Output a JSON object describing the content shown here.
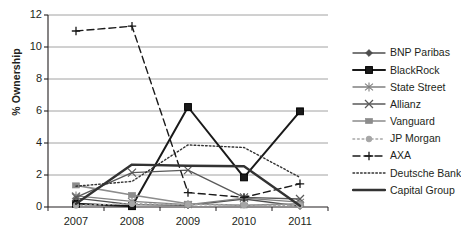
{
  "chart_data": {
    "type": "line",
    "title": "",
    "xlabel": "",
    "ylabel": "% Ownership",
    "categories": [
      "2007",
      "2008",
      "2009",
      "2010",
      "2011"
    ],
    "x_tick_labels": [
      "2007",
      "2008",
      "2009",
      "2010",
      "2011"
    ],
    "y_tick_labels": [
      "0",
      "2",
      "4",
      "6",
      "8",
      "10",
      "12"
    ],
    "y_ticks": [
      0,
      2,
      4,
      6,
      8,
      10,
      12
    ],
    "ylim": [
      0,
      12
    ],
    "grid": "horizontal",
    "legend_position": "right",
    "series": [
      {
        "name": "BNP Paribas",
        "values": [
          0.55,
          0.15,
          0.1,
          0.5,
          0.05
        ],
        "color": "#4d4d4d",
        "marker": "diamond",
        "dash": "solid",
        "width": 1.3
      },
      {
        "name": "BlackRock",
        "values": [
          0.2,
          0.05,
          6.25,
          1.85,
          5.98
        ],
        "color": "#1a1a1a",
        "marker": "square",
        "dash": "solid",
        "width": 2.0
      },
      {
        "name": "State Street",
        "values": [
          0.7,
          0.35,
          0.15,
          0.55,
          0.3
        ],
        "color": "#808080",
        "marker": "star",
        "dash": "solid",
        "width": 1.3
      },
      {
        "name": "Allianz",
        "values": [
          0.6,
          2.15,
          2.3,
          0.6,
          0.5
        ],
        "color": "#595959",
        "marker": "cross",
        "dash": "solid",
        "width": 1.3
      },
      {
        "name": "Vanguard",
        "values": [
          1.35,
          0.75,
          0.2,
          0.1,
          0.2
        ],
        "color": "#8c8c8c",
        "marker": "bar",
        "dash": "solid",
        "width": 1.6
      },
      {
        "name": "JP Morgan",
        "values": [
          0.1,
          0.2,
          0.15,
          0.12,
          0.1
        ],
        "color": "#a6a6a6",
        "marker": "circle",
        "dash": "dotted",
        "width": 1.6
      },
      {
        "name": "AXA",
        "values": [
          11.0,
          11.3,
          0.9,
          0.6,
          1.45
        ],
        "color": "#1a1a1a",
        "marker": "plus",
        "dash": "dashed",
        "width": 1.4
      },
      {
        "name": "Deutsche Bank",
        "values": [
          1.3,
          1.6,
          3.88,
          3.72,
          1.85
        ],
        "color": "#333333",
        "marker": "none",
        "dash": "dense-dotted",
        "width": 1.4
      },
      {
        "name": "Capital Group",
        "values": [
          0.2,
          2.65,
          2.58,
          2.55,
          0.08
        ],
        "color": "#333333",
        "marker": "none",
        "dash": "solid",
        "width": 2.4
      }
    ]
  },
  "legend": {
    "items": [
      {
        "label": "BNP Paribas"
      },
      {
        "label": "BlackRock"
      },
      {
        "label": "State Street"
      },
      {
        "label": "Allianz"
      },
      {
        "label": "Vanguard"
      },
      {
        "label": "JP Morgan"
      },
      {
        "label": "AXA"
      },
      {
        "label": "Deutsche Bank"
      },
      {
        "label": "Capital Group"
      }
    ]
  },
  "colors": {
    "axis": "#231f20",
    "grid": "#8c8c8c",
    "background": "#ffffff"
  }
}
